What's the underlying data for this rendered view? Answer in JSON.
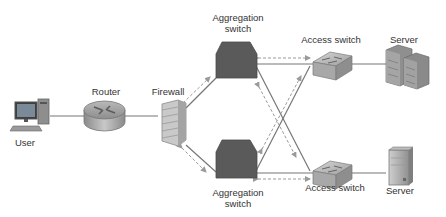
{
  "diagram": {
    "type": "network-topology",
    "colors": {
      "link": "#777777",
      "arrow": "#9a9a9a",
      "aggregation_switch": "#5a5a5a",
      "text": "#333333"
    },
    "nodes": {
      "user": {
        "label": "User",
        "icon": "desktop-computer-icon"
      },
      "router": {
        "label": "Router",
        "icon": "router-icon"
      },
      "firewall": {
        "label": "Firewall",
        "icon": "firewall-icon"
      },
      "agg_top": {
        "label_line1": "Aggregation",
        "label_line2": "switch",
        "icon": "aggregation-switch-icon"
      },
      "agg_bottom": {
        "label_line1": "Aggregation",
        "label_line2": "switch",
        "icon": "aggregation-switch-icon"
      },
      "access_top": {
        "label": "Access switch",
        "icon": "access-switch-icon"
      },
      "access_bottom": {
        "label": "Access switch",
        "icon": "access-switch-icon"
      },
      "server_top": {
        "label": "Server",
        "icon": "server-rack-icon"
      },
      "server_bottom": {
        "label": "Server",
        "icon": "server-tower-icon"
      }
    },
    "links": [
      [
        "user",
        "router"
      ],
      [
        "router",
        "firewall"
      ],
      [
        "firewall",
        "agg_top"
      ],
      [
        "firewall",
        "agg_bottom"
      ],
      [
        "agg_top",
        "access_top"
      ],
      [
        "agg_top",
        "access_bottom"
      ],
      [
        "agg_bottom",
        "access_top"
      ],
      [
        "agg_bottom",
        "access_bottom"
      ],
      [
        "access_top",
        "server_top"
      ],
      [
        "access_bottom",
        "server_bottom"
      ]
    ],
    "bidirectional_flow_arrows": [
      [
        "firewall",
        "agg_top"
      ],
      [
        "firewall",
        "agg_bottom"
      ],
      [
        "agg_top",
        "access_top"
      ],
      [
        "agg_top",
        "access_bottom"
      ],
      [
        "agg_bottom",
        "access_top"
      ],
      [
        "agg_bottom",
        "access_bottom"
      ]
    ]
  }
}
